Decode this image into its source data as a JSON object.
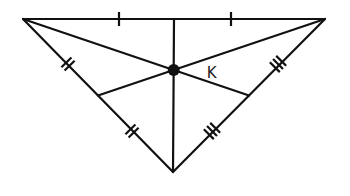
{
  "diagram": {
    "type": "triangle-medians-centroid",
    "colors": {
      "stroke": "#111111",
      "background": "#ffffff",
      "label": "#222222"
    },
    "vertices": {
      "A": {
        "x": 23,
        "y": 19
      },
      "B": {
        "x": 325,
        "y": 19
      },
      "C": {
        "x": 173,
        "y": 172
      }
    },
    "midpoints": {
      "AB": {
        "x": 174,
        "y": 19
      },
      "AC": {
        "x": 98,
        "y": 95.5
      },
      "BC": {
        "x": 249,
        "y": 95.5
      }
    },
    "centroid": {
      "x": 173.7,
      "y": 70,
      "label": "K"
    },
    "tick_marks": {
      "AB": {
        "count": 1,
        "positions": [
          [
            119,
            19
          ],
          [
            231,
            19
          ]
        ]
      },
      "AC": {
        "count": 2,
        "positions": [
          [
            68,
            64
          ],
          [
            132,
            131
          ]
        ]
      },
      "BC": {
        "count": 3,
        "positions": [
          [
            278,
            64
          ],
          [
            212,
            131
          ]
        ]
      }
    }
  }
}
